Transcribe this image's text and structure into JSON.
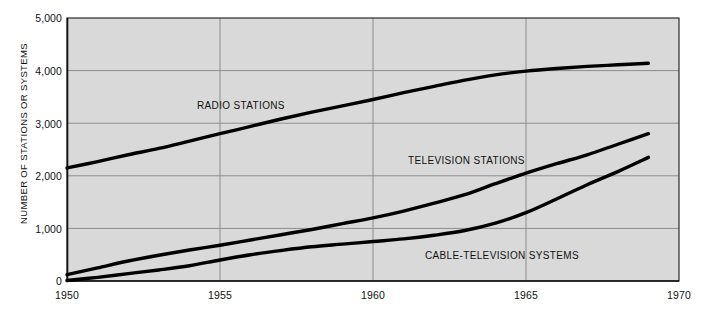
{
  "chart_data": {
    "type": "line",
    "title": "",
    "xlabel": "",
    "ylabel": "NUMBER OF STATIONS OR SYSTEMS",
    "xlim": [
      1950,
      1970
    ],
    "ylim": [
      0,
      5000
    ],
    "grid": true,
    "legend_position": "inline-annotations",
    "xticks": [
      "1950",
      "1955",
      "1960",
      "1965",
      "1970"
    ],
    "xtick_values": [
      1950,
      1955,
      1960,
      1965,
      1970
    ],
    "yticks": [
      "0",
      "1,000",
      "2,000",
      "3,000",
      "4,000",
      "5,000"
    ],
    "ytick_values": [
      0,
      1000,
      2000,
      3000,
      4000,
      5000
    ],
    "x": [
      1950,
      1951,
      1952,
      1953,
      1954,
      1955,
      1956,
      1957,
      1958,
      1959,
      1960,
      1961,
      1962,
      1963,
      1964,
      1965,
      1966,
      1967,
      1968,
      1969
    ],
    "series": [
      {
        "name": "RADIO STATIONS",
        "label": "RADIO STATIONS",
        "color": "#000000",
        "values": [
          2150,
          2270,
          2400,
          2520,
          2660,
          2800,
          2940,
          3080,
          3210,
          3330,
          3450,
          3580,
          3700,
          3820,
          3920,
          3990,
          4040,
          4080,
          4110,
          4140
        ]
      },
      {
        "name": "TELEVISION STATIONS",
        "label": "TELEVISION STATIONS",
        "color": "#000000",
        "values": [
          120,
          250,
          380,
          490,
          590,
          680,
          780,
          880,
          980,
          1090,
          1200,
          1330,
          1480,
          1640,
          1850,
          2050,
          2230,
          2400,
          2600,
          2800
        ]
      },
      {
        "name": "CABLE-TELEVISION SYSTEMS",
        "label": "CABLE-TELEVISION SYSTEMS",
        "color": "#000000",
        "values": [
          10,
          70,
          140,
          210,
          290,
          400,
          500,
          580,
          650,
          700,
          750,
          800,
          870,
          960,
          1100,
          1300,
          1560,
          1830,
          2080,
          2350
        ]
      }
    ],
    "annotations": [
      {
        "text": "RADIO STATIONS",
        "x_px": 197,
        "y_px": 100
      },
      {
        "text": "TELEVISION STATIONS",
        "x_px": 408,
        "y_px": 155
      },
      {
        "text": "CABLE-TELEVISION SYSTEMS",
        "x_px": 425,
        "y_px": 250
      }
    ],
    "colors": {
      "plot_background": "#d9d9d9",
      "line": "#000000",
      "gridline": "#8f8f8f",
      "axis": "#1a1a1a",
      "text": "#111111",
      "page_background": "#ffffff"
    }
  }
}
